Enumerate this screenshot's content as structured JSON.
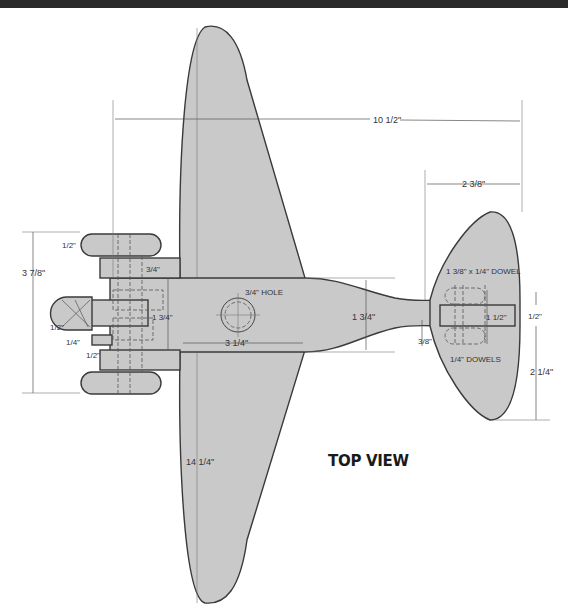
{
  "drawing": {
    "title": "TOP VIEW",
    "colors": {
      "part_fill": "#c9c9c9",
      "outline": "#3a3a3a",
      "header_bar": "#2a2a2a"
    },
    "dimensions": {
      "overall_length": "10 1/2\"",
      "wingspan": "14 1/4\"",
      "landing_gear_width": "3 7/8\"",
      "wheel_width": "1/2\"",
      "gear_block_offset": "3/4\"",
      "fuselage_front_width": "1 3/4\"",
      "hole": "3/4\" HOLE",
      "wing_chord_center": "3 1/4\"",
      "fuselage_mid_width": "1 3/4\"",
      "tail_span_half": "2 3/8\"",
      "stab_offset": "3/8\"",
      "tail_slot": "1/2\"",
      "tail_block": "1 1/2\"",
      "tail_half_span": "2 1/4\"",
      "axle_gap_1": "1/2\"",
      "axle_gap_2": "1/4\"",
      "axle_gap_3": "1/2\""
    },
    "callouts": {
      "dowel_main": "1 3/8\" x 1/4\" DOWEL",
      "dowels": "1/4\" DOWELS"
    }
  }
}
